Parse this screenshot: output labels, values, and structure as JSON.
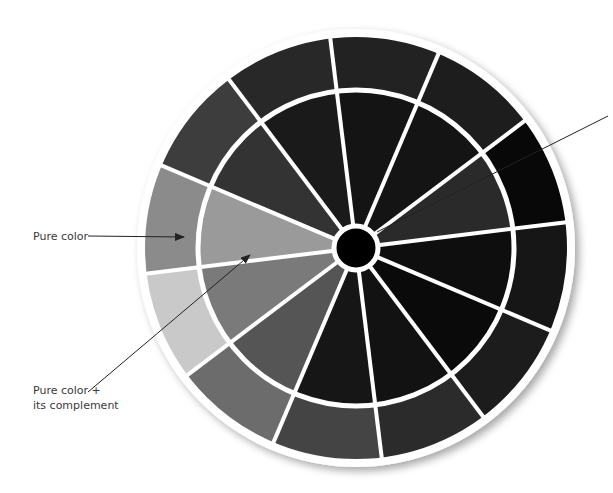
{
  "diagram": {
    "type": "color-wheel",
    "segment_count": 12,
    "outer_ring_colors": [
      "#8b8b8b",
      "#3d3d3d",
      "#282828",
      "#222222",
      "#1d1d1d",
      "#080808",
      "#161616",
      "#1c1c1c",
      "#2b2b2b",
      "#444444",
      "#6c6c6c",
      "#c9c9c9"
    ],
    "inner_wedge_colors": [
      "#9a9a9a",
      "#333333",
      "#1a1a1a",
      "#141414",
      "#141414",
      "#2a2a2a",
      "#0e0e0e",
      "#0a0a0a",
      "#121212",
      "#161616",
      "#555555",
      "#7a7a7a"
    ],
    "hub_color": "#000000",
    "divider_color": "#ffffff"
  },
  "annotations": {
    "pure_color": "Pure color",
    "pure_plus_complement_line1": "Pure color +",
    "pure_plus_complement_line2": "its complement"
  }
}
